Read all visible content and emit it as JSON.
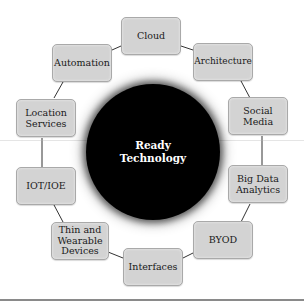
{
  "diagram": {
    "center": {
      "line1": "Ready",
      "line2": "Technology"
    },
    "nodes": [
      {
        "id": "cloud",
        "label": "Cloud"
      },
      {
        "id": "architecture",
        "label": "Architecture"
      },
      {
        "id": "social-media",
        "label": "Social Media"
      },
      {
        "id": "big-data-analytics",
        "label": "Big Data Analytics"
      },
      {
        "id": "byod",
        "label": "BYOD"
      },
      {
        "id": "interfaces",
        "label": "Interfaces"
      },
      {
        "id": "thin-wearable-devices",
        "label": "Thin and Wearable Devices"
      },
      {
        "id": "iot-ioe",
        "label": "IOT/IOE"
      },
      {
        "id": "location-services",
        "label": "Location Services"
      },
      {
        "id": "automation",
        "label": "Automation"
      }
    ],
    "colors": {
      "node_fill": "#d3d3d3",
      "node_border": "#a9a9a9",
      "hub": "#000000",
      "hub_text": "#ffffff"
    }
  }
}
